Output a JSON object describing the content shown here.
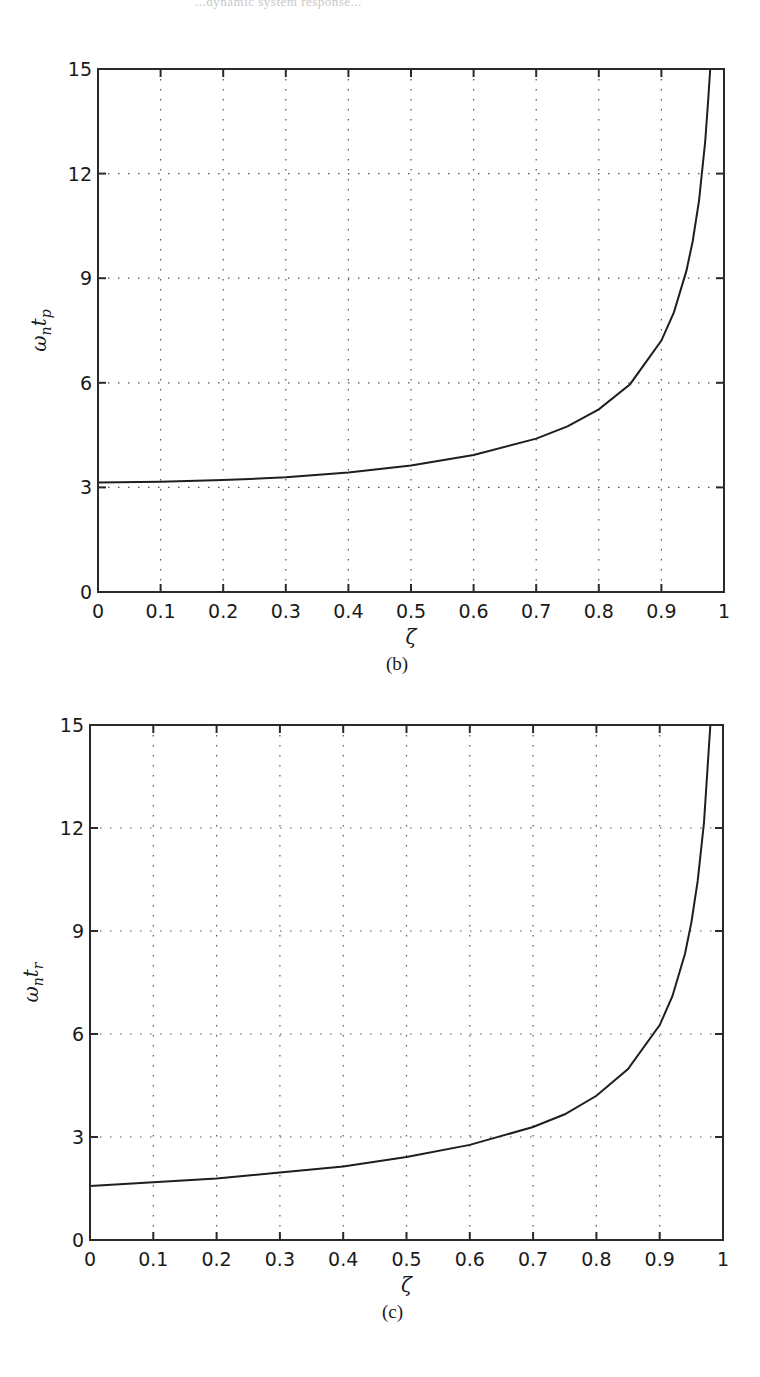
{
  "page": {
    "header_fragment": "...dynamic system response..."
  },
  "chart_data": [
    {
      "id": "b",
      "type": "line",
      "caption": "(b)",
      "title": "",
      "xlabel": "ζ",
      "ylabel": "ωntp",
      "ylabel_parts": {
        "omega": "ω",
        "n": "n",
        "t": "t",
        "sub": "p"
      },
      "xlim": [
        0,
        1
      ],
      "ylim": [
        0,
        15
      ],
      "grid": true,
      "x_ticks": [
        "0",
        "0.1",
        "0.2",
        "0.3",
        "0.4",
        "0.5",
        "0.6",
        "0.7",
        "0.8",
        "0.9",
        "1"
      ],
      "y_ticks": [
        "0",
        "3",
        "6",
        "9",
        "12",
        "15"
      ],
      "box": {
        "left": 98,
        "top": 69,
        "right": 724,
        "bottom": 592
      },
      "series": [
        {
          "name": "ωn tp",
          "x": [
            0,
            0.1,
            0.2,
            0.3,
            0.4,
            0.5,
            0.6,
            0.7,
            0.75,
            0.8,
            0.85,
            0.9,
            0.92,
            0.94,
            0.95,
            0.96,
            0.97,
            0.975,
            0.978
          ],
          "y": [
            3.14,
            3.16,
            3.21,
            3.29,
            3.43,
            3.63,
            3.93,
            4.4,
            4.75,
            5.24,
            5.96,
            7.21,
            8.02,
            9.21,
            10.06,
            11.22,
            12.92,
            14.2,
            15.0
          ]
        }
      ]
    },
    {
      "id": "c",
      "type": "line",
      "caption": "(c)",
      "title": "",
      "xlabel": "ζ",
      "ylabel": "ωntr",
      "ylabel_parts": {
        "omega": "ω",
        "n": "n",
        "t": "t",
        "sub": "r"
      },
      "xlim": [
        0,
        1
      ],
      "ylim": [
        0,
        15
      ],
      "grid": true,
      "x_ticks": [
        "0",
        "0.1",
        "0.2",
        "0.3",
        "0.4",
        "0.5",
        "0.6",
        "0.7",
        "0.8",
        "0.9",
        "1"
      ],
      "y_ticks": [
        "0",
        "3",
        "6",
        "9",
        "12",
        "15"
      ],
      "box": {
        "left": 90,
        "top": 725,
        "right": 723,
        "bottom": 1240
      },
      "series": [
        {
          "name": "ωn tr",
          "x": [
            0,
            0.1,
            0.2,
            0.3,
            0.4,
            0.5,
            0.6,
            0.7,
            0.75,
            0.8,
            0.85,
            0.9,
            0.92,
            0.94,
            0.95,
            0.96,
            0.97,
            0.98,
            0.985,
            0.988
          ],
          "y": [
            1.57,
            1.68,
            1.79,
            1.97,
            2.14,
            2.42,
            2.77,
            3.29,
            3.66,
            4.2,
            4.98,
            6.26,
            7.1,
            8.34,
            9.25,
            10.46,
            12.16,
            14.98,
            17.3,
            19.5
          ]
        }
      ]
    }
  ]
}
